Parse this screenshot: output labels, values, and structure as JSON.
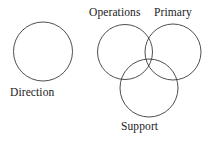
{
  "figure": {
    "background_color": "#ffffff",
    "stroke_color": "#3a3a3a",
    "text_color": "#1a1a1a",
    "width": 211,
    "height": 142
  },
  "standalone_group": {
    "label": "Direction",
    "circle": {
      "name": "direction-circle",
      "cx": 43,
      "cy": 51.5,
      "r": 29.5
    }
  },
  "venn_group": {
    "circles": [
      {
        "name": "operations-circle",
        "label": "Operations",
        "cx": 125,
        "cy": 52,
        "r": 27.5
      },
      {
        "name": "primary-circle",
        "label": "Primary",
        "cx": 173,
        "cy": 52,
        "r": 28
      },
      {
        "name": "support-circle",
        "label": "Support",
        "cx": 149,
        "cy": 88,
        "r": 29
      }
    ],
    "labels": {
      "operations": "Operations",
      "primary": "Primary",
      "support": "Support"
    }
  }
}
